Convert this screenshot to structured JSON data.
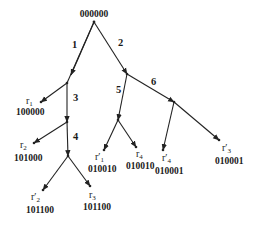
{
  "diagram": {
    "type": "tree",
    "root": {
      "code": "000000"
    },
    "edges": [
      {
        "label": "1"
      },
      {
        "label": "2"
      },
      {
        "label": "3"
      },
      {
        "label": "4"
      },
      {
        "label": "5"
      },
      {
        "label": "6"
      }
    ],
    "leaves": [
      {
        "name": "r",
        "prime": "",
        "sub": "1",
        "code": "100000"
      },
      {
        "name": "r",
        "prime": "",
        "sub": "2",
        "code": "101000"
      },
      {
        "name": "r",
        "prime": "′",
        "sub": "2",
        "code": "101100"
      },
      {
        "name": "r",
        "prime": "",
        "sub": "3",
        "code": "101100"
      },
      {
        "name": "r",
        "prime": "′",
        "sub": "1",
        "code": "010010"
      },
      {
        "name": "r",
        "prime": "",
        "sub": "4",
        "code": "010010"
      },
      {
        "name": "r",
        "prime": "′",
        "sub": "4",
        "code": "010001"
      },
      {
        "name": "r",
        "prime": "′",
        "sub": "3",
        "code": "010001"
      }
    ]
  }
}
